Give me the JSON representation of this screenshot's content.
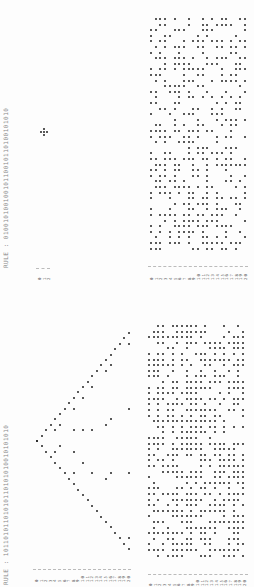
{
  "document": {
    "orientation": "rotated-90-ccw",
    "sections": [
      {
        "id": "upper",
        "rule_label": "RULE : 01001010010010110010110100101010",
        "row_labels_small": [
          "0",
          "1",
          "2"
        ],
        "row_labels_large": [
          "0",
          "1",
          "2",
          "3",
          "4",
          "5",
          "6",
          "7",
          "8",
          "9",
          "10",
          "11",
          "12",
          "13",
          "14",
          "15",
          "16",
          "17",
          "18",
          "19",
          "20"
        ]
      },
      {
        "id": "lower",
        "rule_label": "RULE : 10110101101010110101010010101010",
        "row_labels_small": [
          "0",
          "1",
          "2",
          "3",
          "4",
          "5",
          "6",
          "7",
          "8",
          "9",
          "10",
          "11",
          "12",
          "13",
          "14",
          "15",
          "16",
          "17",
          "18",
          "19",
          "20"
        ],
        "row_labels_large": [
          "0",
          "1",
          "2",
          "3",
          "4",
          "5",
          "6",
          "7",
          "8",
          "9",
          "10",
          "11",
          "12",
          "13",
          "14",
          "15",
          "16",
          "17",
          "18",
          "19",
          "20"
        ]
      }
    ]
  },
  "colors": {
    "ink": "#222222",
    "label": "#888888",
    "paper": "#fdfdfd"
  }
}
